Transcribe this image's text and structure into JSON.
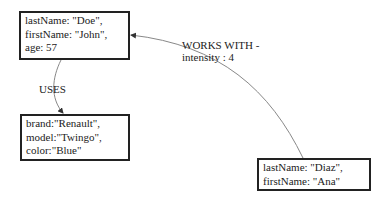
{
  "nodes": [
    {
      "id": "person-doe",
      "lines": [
        "lastName:  \"Doe\",",
        "firstName:  \"John\",",
        "age:  57"
      ]
    },
    {
      "id": "car-renault",
      "lines": [
        "brand:\"Renault\",",
        "model:\"Twingo\",",
        "color:\"Blue\""
      ]
    },
    {
      "id": "person-diaz",
      "lines": [
        "lastName:  \"Diaz\",",
        "firstName:  \"Ana\""
      ]
    }
  ],
  "edges": [
    {
      "from": "person-doe",
      "to": "car-renault",
      "label_lines": [
        "USES"
      ]
    },
    {
      "from": "person-diaz",
      "to": "person-doe",
      "label_lines": [
        "WORKS WITH -",
        "intensity :  4"
      ]
    }
  ],
  "colors": {
    "stroke": "#222222",
    "edge": "#888888",
    "text": "#222222"
  }
}
